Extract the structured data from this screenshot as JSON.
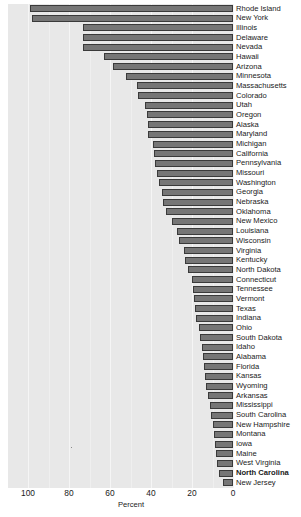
{
  "chart_data": {
    "type": "bar",
    "orientation": "horizontal",
    "title": "",
    "subtitle": "",
    "xlabel": "Percent",
    "ylabel": "",
    "xlim": [
      100,
      0
    ],
    "x_axis_reversed": true,
    "xticks": [
      100,
      80,
      60,
      40,
      20,
      0
    ],
    "xtick_labels": [
      "100",
      "80",
      "60",
      "40",
      "20",
      "0"
    ],
    "grid": "vertical",
    "legend": "none",
    "highlighted_category": "North Carolina",
    "bar_color": "#767676",
    "bar_edge_color": "#3a3a3a",
    "panel_color": "#e8e8e8",
    "gridline_color": "#f5f5f5",
    "categories": [
      "Rhode Island",
      "New York",
      "Illinois",
      "Delaware",
      "Nevada",
      "Hawaii",
      "Arizona",
      "Minnesota",
      "Massachusetts",
      "Colorado",
      "Utah",
      "Oregon",
      "Alaska",
      "Maryland",
      "Michigan",
      "California",
      "Pennsylvania",
      "Missouri",
      "Washington",
      "Georgia",
      "Nebraska",
      "Oklahoma",
      "New Mexico",
      "Louisiana",
      "Wisconsin",
      "Virginia",
      "Kentucky",
      "North Dakota",
      "Connecticut",
      "Tennessee",
      "Vermont",
      "Texas",
      "Indiana",
      "Ohio",
      "South Dakota",
      "Idaho",
      "Alabama",
      "Florida",
      "Kansas",
      "Wyoming",
      "Arkansas",
      "Mississippi",
      "South Carolina",
      "New Hampshire",
      "Montana",
      "Iowa",
      "Maine",
      "West Virginia",
      "North Carolina",
      "New Jersey"
    ],
    "values": [
      99.0,
      98.0,
      73.0,
      73.0,
      73.0,
      63.0,
      58.5,
      52.0,
      47.0,
      46.5,
      43.0,
      42.0,
      41.5,
      41.5,
      39.0,
      38.5,
      38.0,
      37.0,
      36.0,
      34.5,
      34.0,
      32.5,
      30.0,
      27.5,
      26.5,
      24.0,
      23.5,
      22.0,
      20.0,
      19.5,
      19.0,
      18.5,
      18.0,
      16.5,
      16.0,
      15.0,
      14.5,
      14.0,
      13.5,
      13.0,
      12.0,
      11.0,
      10.5,
      10.0,
      9.5,
      9.0,
      8.5,
      8.0,
      7.0,
      5.0
    ]
  }
}
